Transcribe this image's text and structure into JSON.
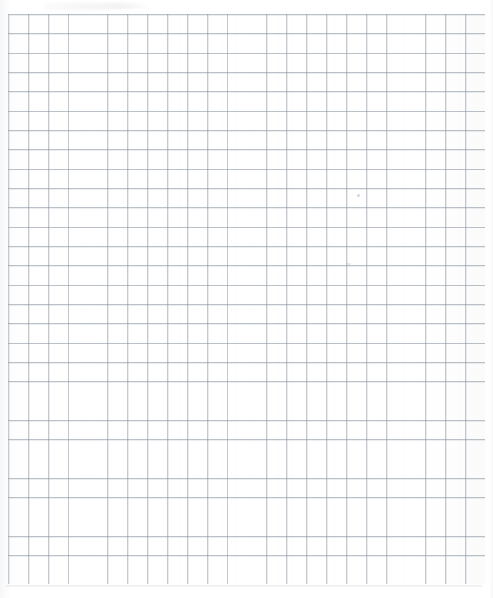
{
  "document": {
    "kind": "scanned-graph-paper",
    "description": "Blank sheet of quadrille / graph paper, scanned",
    "page_width_px": 493,
    "page_height_px": 598,
    "text_content": "",
    "annotations": []
  },
  "sheet": {
    "paper_color": "#ffffff",
    "background_color": "#ffffff",
    "grid_line_color": "#7e8896",
    "grid_ghost_color": "#969eac",
    "edge_shadow_color": "#8c919b"
  },
  "grid": {
    "left_px": 8,
    "top_px": 14,
    "right_px": 485,
    "bottom_px": 584,
    "cell_width_px": 19.88,
    "cell_height_px": 19.33,
    "columns": 24,
    "rows": 29,
    "line_weight_px": 0.9,
    "style": "uniform-square-quadrille"
  },
  "margins": {
    "top_px": 14,
    "left_px": 8,
    "right_px": 8,
    "bottom_px": 14
  },
  "artifacts": {
    "top_smudge": {
      "x": 44,
      "y": 0,
      "width": 104,
      "height": 11
    },
    "speck_upper": {
      "x": 357,
      "y": 194,
      "size": 3
    },
    "speck_lower": {
      "x": 346,
      "y": 263,
      "size": 5
    },
    "bottom_edge_shadow": {
      "x": 6,
      "y": 585,
      "width": 476,
      "height": 3
    }
  }
}
